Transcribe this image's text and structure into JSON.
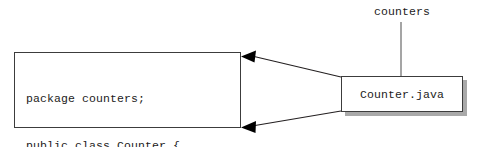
{
  "diagram": {
    "type": "package-file-mapping",
    "package_label": {
      "text": "counters",
      "role": "package-name-annotation"
    },
    "source_file_node": {
      "text": "Counter.java",
      "role": "file-node",
      "has_drop_shadow": true
    },
    "code_node": {
      "role": "source-code-listing",
      "lines": [
        "package counters;",
        "public class Counter {",
        "    ...",
        "}"
      ]
    },
    "connectors": [
      {
        "name": "upper-expansion-edge",
        "from": "file-node",
        "to": "code-node-top-right",
        "arrowhead": "filled-triangle",
        "direction": "left"
      },
      {
        "name": "lower-expansion-edge",
        "from": "file-node",
        "to": "code-node-bottom-right",
        "arrowhead": "filled-triangle",
        "direction": "left"
      },
      {
        "name": "package-leader-line",
        "from": "package-label",
        "to": "file-node-top",
        "arrowhead": "none",
        "direction": "down"
      }
    ],
    "colors": {
      "background": "#ffffff",
      "stroke": "#231f20",
      "text": "#1c1c1c",
      "shadow": "#a9a9a9",
      "box_fill": "#ffffff"
    }
  }
}
